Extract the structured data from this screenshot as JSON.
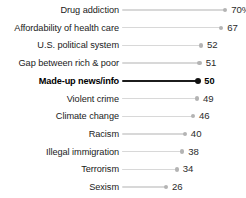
{
  "chart_data": {
    "type": "bar",
    "title": "",
    "subtitle": "",
    "xlabel": "",
    "ylabel": "",
    "orientation": "horizontal",
    "grid": false,
    "legend": false,
    "xlim": [
      0,
      75
    ],
    "highlight_category": "Made-up news/info",
    "categories": [
      "Drug addiction",
      "Affordability of health care",
      "U.S. political system",
      "Gap between rich & poor",
      "Made-up news/info",
      "Violent crime",
      "Climate change",
      "Racism",
      "Illegal immigration",
      "Terrorism",
      "Sexism"
    ],
    "values": [
      70,
      67,
      52,
      51,
      50,
      49,
      46,
      40,
      38,
      34,
      26
    ],
    "value_labels": [
      "70%",
      "67",
      "52",
      "51",
      "50",
      "49",
      "46",
      "40",
      "38",
      "34",
      "26"
    ]
  },
  "colors": {
    "background": "#ffffff",
    "track": "#d8d8d8",
    "dot": "#b4b4b4",
    "highlight_track": "#1c1c1c",
    "highlight_dot": "#111111",
    "label_text": "#1a1a1a",
    "value_text": "#2b2b2b"
  },
  "rows": [
    {
      "label": "Drug addiction",
      "value": 70,
      "value_label": "70%",
      "highlight": false
    },
    {
      "label": "Affordability of health care",
      "value": 67,
      "value_label": "67",
      "highlight": false
    },
    {
      "label": "U.S. political system",
      "value": 52,
      "value_label": "52",
      "highlight": false
    },
    {
      "label": "Gap between rich & poor",
      "value": 51,
      "value_label": "51",
      "highlight": false
    },
    {
      "label": "Made-up news/info",
      "value": 50,
      "value_label": "50",
      "highlight": true
    },
    {
      "label": "Violent crime",
      "value": 49,
      "value_label": "49",
      "highlight": false
    },
    {
      "label": "Climate change",
      "value": 46,
      "value_label": "46",
      "highlight": false
    },
    {
      "label": "Racism",
      "value": 40,
      "value_label": "40",
      "highlight": false
    },
    {
      "label": "Illegal immigration",
      "value": 38,
      "value_label": "38",
      "highlight": false
    },
    {
      "label": "Terrorism",
      "value": 34,
      "value_label": "34",
      "highlight": false
    },
    {
      "label": "Sexism",
      "value": 26,
      "value_label": "26",
      "highlight": false
    }
  ],
  "layout": {
    "first_row_center_y": 10,
    "row_step_y": 17.7,
    "track_left_x": 122,
    "px_per_unit": 1.345,
    "value_gap_px": 6
  }
}
